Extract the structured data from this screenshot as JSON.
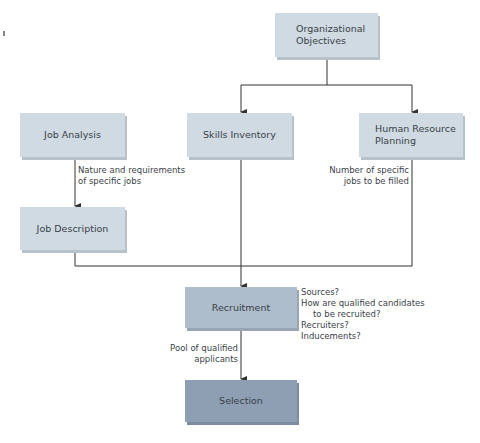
{
  "diagram": {
    "nodes": {
      "org_objectives": {
        "line1": "Organizational",
        "line2": "Objectives"
      },
      "job_analysis": {
        "label": "Job Analysis"
      },
      "skills_inventory": {
        "label": "Skills Inventory"
      },
      "hr_planning": {
        "line1": "Human Resource",
        "line2": "Planning"
      },
      "job_description": {
        "label": "Job Description"
      },
      "recruitment": {
        "label": "Recruitment"
      },
      "selection": {
        "label": "Selection"
      }
    },
    "annotations": {
      "job_analysis_edge": {
        "line1": "Nature and requirements",
        "line2": "of specific jobs"
      },
      "hr_planning_edge": {
        "line1": "Number of specific",
        "line2": "jobs to be filled"
      },
      "recruitment_questions": {
        "line1": "Sources?",
        "line2": "How are qualified candidates",
        "line3": "to be recruited?",
        "line4": "Recruiters?",
        "line5": "Inducements?"
      },
      "recruitment_edge": {
        "line1": "Pool of qualified",
        "line2": "applicants"
      }
    },
    "colors": {
      "light_box": "#cfdae2",
      "recruitment_box": "#aebdcb",
      "selection_box": "#8e9fb3",
      "line": "#333333"
    }
  }
}
